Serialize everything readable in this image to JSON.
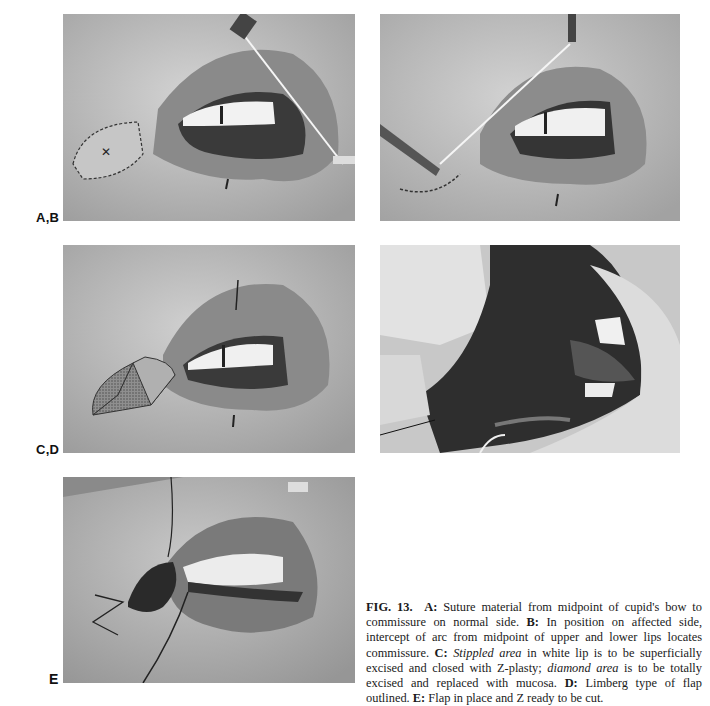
{
  "figure": {
    "number": "FIG. 13.",
    "panel_labels": {
      "ab": "A,B",
      "cd": "C,D",
      "e": "E"
    },
    "panels": [
      {
        "id": "A",
        "description": "Suture material from midpoint of cupid's bow to commissure on normal side"
      },
      {
        "id": "B",
        "description": "Suture on affected side locating commissure"
      },
      {
        "id": "C",
        "description": "Stippled area and diamond area outlined on lip"
      },
      {
        "id": "D",
        "description": "Limberg type of flap outlined"
      },
      {
        "id": "E",
        "description": "Flap in place and Z ready to be cut"
      }
    ],
    "caption": {
      "lead": "FIG. 13.",
      "a_label": "A:",
      "a_text": " Suture material from midpoint of cupid's bow to commissure on normal side. ",
      "b_label": "B:",
      "b_text": " In position on affected side, intercept of arc from midpoint of upper and lower lips locates commissure. ",
      "c_label": "C:",
      "c_italic1": "Stippled area",
      "c_text1": " in white lip is to be superficially excised and closed with Z-plasty; ",
      "c_italic2": "diamond area",
      "c_text2": " is to be totally excised and replaced with mucosa. ",
      "d_label": "D:",
      "d_text": " Limberg type of flap outlined. ",
      "e_label": "E:",
      "e_text": " Flap in place and Z ready to be cut."
    }
  }
}
